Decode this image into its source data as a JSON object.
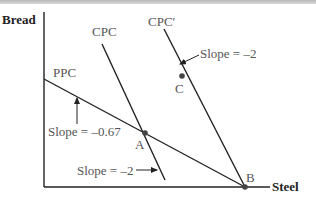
{
  "diagram": {
    "axes": {
      "y_label": "Bread",
      "x_label": "Steel"
    },
    "curves": [
      {
        "id": "ppc",
        "label": "PPC",
        "slope_label": "Slope = –0.67"
      },
      {
        "id": "cpc",
        "label": "CPC",
        "slope_label": "Slope = –2"
      },
      {
        "id": "cpc_prime",
        "label": "CPC′",
        "slope_label": "Slope = –2"
      }
    ],
    "points": [
      {
        "id": "A",
        "label": "A"
      },
      {
        "id": "B",
        "label": "B"
      },
      {
        "id": "C",
        "label": "C"
      }
    ],
    "colors": {
      "line": "#222222",
      "label": "#555555",
      "point": "#444444"
    }
  }
}
